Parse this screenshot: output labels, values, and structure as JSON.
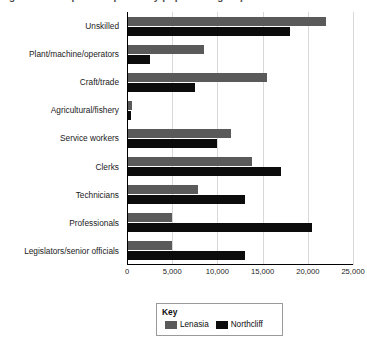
{
  "figure": {
    "title_fragment": "Figure 1: Occupational profile by population group",
    "legend_title": "Key"
  },
  "chart_data": {
    "type": "bar",
    "orientation": "horizontal",
    "title": "",
    "xlabel": "",
    "ylabel": "",
    "xlim": [
      0,
      25000
    ],
    "xticks": [
      0,
      5000,
      10000,
      15000,
      20000,
      25000
    ],
    "xtick_labels": [
      "0",
      "5,000",
      "10,000",
      "15,000",
      "20,000",
      "25,000"
    ],
    "grid": true,
    "legend_position": "bottom-center",
    "categories": [
      "Unskilled",
      "Plant/machine/operators",
      "Craft/trade",
      "Agricultural/fishery",
      "Service workers",
      "Clerks",
      "Technicians",
      "Professionals",
      "Legislators/senior officials"
    ],
    "series": [
      {
        "name": "Lenasia",
        "color": "#5a5a5a",
        "values": [
          22000,
          8500,
          15500,
          500,
          11500,
          13800,
          7800,
          5000,
          5000
        ]
      },
      {
        "name": "Northcliff",
        "color": "#0c0c0c",
        "values": [
          18000,
          2500,
          7500,
          400,
          10000,
          17000,
          13000,
          20500,
          13000
        ]
      }
    ]
  }
}
